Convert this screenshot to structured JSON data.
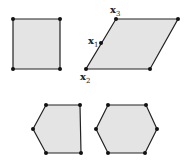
{
  "figure": {
    "fill_color": "#e4e4e4",
    "stroke_color": "#222222",
    "shapes": [
      {
        "name": "square",
        "points": [
          [
            13,
            19
          ],
          [
            60,
            19
          ],
          [
            60,
            69
          ],
          [
            13,
            69
          ]
        ]
      },
      {
        "name": "parallelogram",
        "points": [
          [
            116,
            19
          ],
          [
            178,
            19
          ],
          [
            150,
            69
          ],
          [
            86,
            69
          ]
        ]
      },
      {
        "name": "pentagon",
        "points": [
          [
            46,
            105
          ],
          [
            80,
            105
          ],
          [
            81,
            153
          ],
          [
            46,
            153
          ],
          [
            33,
            129
          ]
        ]
      },
      {
        "name": "hexagon",
        "points": [
          [
            108,
            105
          ],
          [
            146,
            105
          ],
          [
            157,
            129
          ],
          [
            145,
            153
          ],
          [
            108,
            153
          ],
          [
            96,
            129
          ]
        ]
      }
    ],
    "labels": {
      "x1": {
        "base": "x",
        "sub": "1"
      },
      "x2": {
        "base": "x",
        "sub": "2"
      },
      "x3": {
        "base": "x",
        "sub": "3"
      }
    }
  }
}
